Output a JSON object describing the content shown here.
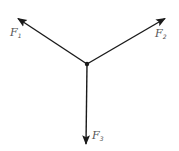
{
  "diagram": {
    "center": {
      "x": 87,
      "y": 64
    },
    "line_color": "#1a1a1a",
    "label_color": "#555555",
    "forces": [
      {
        "name": "F",
        "subscript": "1",
        "tip": {
          "x": 17,
          "y": 18
        },
        "label_pos": {
          "x": 10,
          "y": 36
        }
      },
      {
        "name": "F",
        "subscript": "2",
        "tip": {
          "x": 166,
          "y": 18
        },
        "label_pos": {
          "x": 155,
          "y": 37
        }
      },
      {
        "name": "F",
        "subscript": "3",
        "tip": {
          "x": 86,
          "y": 145
        },
        "label_pos": {
          "x": 92,
          "y": 139
        }
      }
    ]
  }
}
